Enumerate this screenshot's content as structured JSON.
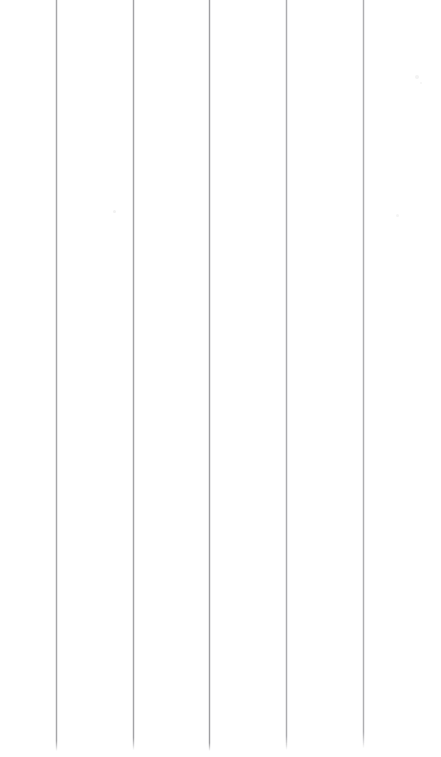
{
  "document": {
    "kind": "scanned-page",
    "content_type": "blank-ruled-columnar-paper",
    "page_label": "",
    "visible_text": "",
    "text_content_present": false,
    "background_color": "#ffffff",
    "width_px": 441,
    "height_px": 757,
    "orientation": "portrait"
  },
  "ruling": {
    "type": "vertical",
    "line_count": 5,
    "line_color": "#a6a6a8",
    "line_halo_color": "#dcdcde",
    "line_width_px": 1,
    "spacing_px": 76.7,
    "top_px": 0,
    "lines": [
      {
        "id": "rule-1",
        "x_px": 56,
        "top_px": 0,
        "height_px": 751,
        "color": "#a6a6a8",
        "opacity": 1.0,
        "fade_bottom_px": 10
      },
      {
        "id": "rule-2",
        "x_px": 133,
        "top_px": 0,
        "height_px": 750,
        "color": "#a3a3a6",
        "opacity": 1.0,
        "fade_bottom_px": 12
      },
      {
        "id": "rule-3",
        "x_px": 209,
        "top_px": 0,
        "height_px": 751,
        "color": "#9e9ea1",
        "opacity": 1.0,
        "fade_bottom_px": 8
      },
      {
        "id": "rule-4",
        "x_px": 286,
        "top_px": 0,
        "height_px": 750,
        "color": "#a9a9ac",
        "opacity": 0.96,
        "fade_bottom_px": 14
      },
      {
        "id": "rule-5",
        "x_px": 363,
        "top_px": 0,
        "height_px": 748,
        "color": "#aaaaad",
        "opacity": 0.94,
        "fade_bottom_px": 16
      }
    ]
  },
  "columns": {
    "count": 6,
    "left_margin_px": 56,
    "right_margin_px": 78,
    "regions": [
      {
        "id": "margin-left",
        "x_px": 0,
        "width_px": 56,
        "content": ""
      },
      {
        "id": "column-1",
        "x_px": 56,
        "width_px": 77,
        "content": ""
      },
      {
        "id": "column-2",
        "x_px": 133,
        "width_px": 76,
        "content": ""
      },
      {
        "id": "column-3",
        "x_px": 209,
        "width_px": 77,
        "content": ""
      },
      {
        "id": "column-4",
        "x_px": 286,
        "width_px": 77,
        "content": ""
      },
      {
        "id": "margin-right",
        "x_px": 363,
        "width_px": 78,
        "content": ""
      }
    ]
  },
  "artifacts": {
    "description": "faint scanner speckles / dust",
    "count": 4,
    "items": [
      {
        "id": "speck-1",
        "x_px": 113,
        "y_px": 210,
        "size_px": 3,
        "color": "#f1f1f1"
      },
      {
        "id": "speck-2",
        "x_px": 415,
        "y_px": 75,
        "size_px": 4,
        "color": "#f3f3f3"
      },
      {
        "id": "speck-3",
        "x_px": 420,
        "y_px": 82,
        "size_px": 2,
        "color": "#f5f5f5"
      },
      {
        "id": "speck-4",
        "x_px": 396,
        "y_px": 214,
        "size_px": 3,
        "color": "#f4f4f4"
      }
    ]
  }
}
